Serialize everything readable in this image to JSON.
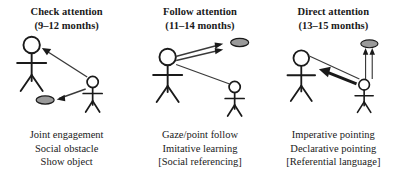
{
  "figure": {
    "type": "diagram",
    "background_color": "#ffffff",
    "ink_color": "#1a1a1a",
    "object_fill_color": "#9a9a9a",
    "panel_count": 3
  },
  "panels": [
    {
      "heading_line1": "Check attention",
      "heading_line2": "(9–12 months)",
      "age_range": "9–12 months",
      "captions": [
        "Joint engagement",
        "Social obstacle",
        "Show object"
      ],
      "diagram": {
        "adult_label": "adult-stick-figure",
        "infant_label": "infant-stick-figure",
        "object_label": "object-oval",
        "arrows": [
          "infant-to-adult-head",
          "infant-to-object"
        ]
      }
    },
    {
      "heading_line1": "Follow attention",
      "heading_line2": "(11–14 months)",
      "age_range": "11–14 months",
      "captions": [
        "Gaze/point follow",
        "Imitative learning",
        "[Social referencing]"
      ],
      "diagram": {
        "adult_label": "adult-stick-figure",
        "infant_label": "infant-stick-figure",
        "object_label": "object-oval",
        "arrows": [
          "adult-to-object-upper",
          "adult-to-object-lower",
          "adult-to-infant-line"
        ]
      }
    },
    {
      "heading_line1": "Direct attention",
      "heading_line2": "(13–15 months)",
      "age_range": "13–15 months",
      "captions": [
        "Imperative pointing",
        "Declarative pointing",
        "[Referential language]"
      ],
      "diagram": {
        "adult_label": "adult-stick-figure",
        "infant_label": "infant-stick-figure",
        "object_label": "object-oval",
        "arrows": [
          "infant-to-adult-thick",
          "adult-head-to-infant-line",
          "infant-to-object-left",
          "infant-to-object-right"
        ]
      }
    }
  ]
}
